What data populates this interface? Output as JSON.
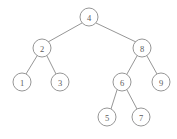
{
  "figure": {
    "kind": "binary-search-tree-diagram",
    "width": 177,
    "height": 139,
    "background_color": "#ffffff",
    "stroke_color": "#8a8a8a",
    "label_color": "#5c5c5c",
    "node_radius": 9
  },
  "nodes": [
    {
      "id": "n4",
      "label": "4",
      "cx": 89,
      "cy": 17,
      "level": 1
    },
    {
      "id": "n2",
      "label": "2",
      "cx": 42,
      "cy": 48,
      "level": 2
    },
    {
      "id": "n8",
      "label": "8",
      "cx": 142,
      "cy": 48,
      "level": 2
    },
    {
      "id": "n1",
      "label": "1",
      "cx": 22,
      "cy": 82,
      "level": 3
    },
    {
      "id": "n3",
      "label": "3",
      "cx": 60,
      "cy": 82,
      "level": 3
    },
    {
      "id": "n6",
      "label": "6",
      "cx": 122,
      "cy": 82,
      "level": 3
    },
    {
      "id": "n9",
      "label": "9",
      "cx": 161,
      "cy": 82,
      "level": 3
    },
    {
      "id": "n5",
      "label": "5",
      "cx": 107,
      "cy": 117,
      "level": 4
    },
    {
      "id": "n7",
      "label": "7",
      "cx": 141,
      "cy": 117,
      "level": 4
    }
  ],
  "edges": [
    {
      "id": "e4-2",
      "from": "n4",
      "to": "n2",
      "x1": 82,
      "y1": 23,
      "x2": 48,
      "y2": 42
    },
    {
      "id": "e4-8",
      "from": "n4",
      "to": "n8",
      "x1": 96,
      "y1": 23,
      "x2": 136,
      "y2": 42
    },
    {
      "id": "e2-1",
      "from": "n2",
      "to": "n1",
      "x1": 37,
      "y1": 56,
      "x2": 26,
      "y2": 74
    },
    {
      "id": "e2-3",
      "from": "n2",
      "to": "n3",
      "x1": 47,
      "y1": 56,
      "x2": 56,
      "y2": 74
    },
    {
      "id": "e8-6",
      "from": "n8",
      "to": "n6",
      "x1": 137,
      "y1": 56,
      "x2": 127,
      "y2": 74
    },
    {
      "id": "e8-9",
      "from": "n8",
      "to": "n9",
      "x1": 147,
      "y1": 56,
      "x2": 157,
      "y2": 74
    },
    {
      "id": "e6-5",
      "from": "n6",
      "to": "n5",
      "x1": 117,
      "y1": 90,
      "x2": 111,
      "y2": 109
    },
    {
      "id": "e6-7",
      "from": "n6",
      "to": "n7",
      "x1": 127,
      "y1": 90,
      "x2": 137,
      "y2": 109
    }
  ]
}
